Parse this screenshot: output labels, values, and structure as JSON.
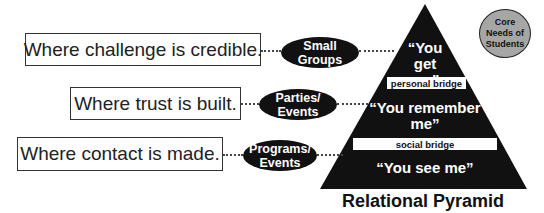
{
  "diagram": {
    "title": "Relational Pyramid",
    "core_needs_label": "Core Needs of Students",
    "rows": [
      {
        "where": "Where challenge is credible.",
        "venue": "Small Groups",
        "level": "“You get me”"
      },
      {
        "where": "Where trust is built.",
        "venue": "Parties/ Events",
        "level": "“You remember me”"
      },
      {
        "where": "Where contact is made.",
        "venue": "Programs/ Events",
        "level": "“You see me”"
      }
    ],
    "bridges": [
      "personal bridge",
      "social bridge"
    ],
    "colors": {
      "pyramid": "#111111",
      "core_needs_fill": "#a6a6a6",
      "oval": "#111111"
    }
  }
}
